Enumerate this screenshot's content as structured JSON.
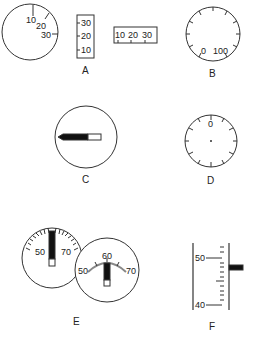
{
  "panels": {
    "A": {
      "label": "A",
      "round_dial": {
        "ticks": [
          "10",
          "20",
          "30"
        ]
      },
      "vertical_scale": {
        "ticks": [
          "30",
          "20",
          "10"
        ]
      },
      "horizontal_scale": {
        "ticks": [
          "10",
          "20",
          "30"
        ]
      }
    },
    "B": {
      "label": "B",
      "ticks": [
        "0",
        "100"
      ]
    },
    "C": {
      "label": "C"
    },
    "D": {
      "label": "D",
      "ticks": [
        "0"
      ]
    },
    "E": {
      "label": "E",
      "left_dial": {
        "ticks": [
          "50",
          "70"
        ]
      },
      "right_dial": {
        "ticks": [
          "50",
          "60",
          "70"
        ]
      }
    },
    "F": {
      "label": "F",
      "ticks": [
        "50",
        "40"
      ]
    }
  },
  "colors": {
    "stroke": "#333333",
    "fill": "#111111",
    "background": "#ffffff"
  }
}
